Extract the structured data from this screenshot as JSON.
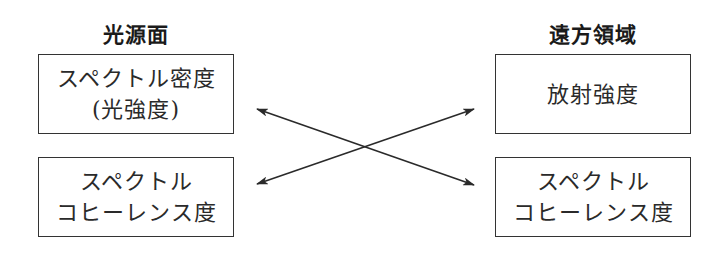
{
  "left_column": {
    "heading": "光源面",
    "boxes": [
      {
        "lines": [
          "スペクトル密度",
          "(光強度)"
        ]
      },
      {
        "lines": [
          "スペクトル",
          "コヒーレンス度"
        ]
      }
    ]
  },
  "right_column": {
    "heading": "遠方領域",
    "boxes": [
      {
        "lines": [
          "放射強度"
        ]
      },
      {
        "lines": [
          "スペクトル",
          "コヒーレンス度"
        ]
      }
    ]
  },
  "arrows": [
    {
      "from": "left_column.boxes.0",
      "to": "right_column.boxes.1",
      "type": "double-headed"
    },
    {
      "from": "left_column.boxes.1",
      "to": "right_column.boxes.0",
      "type": "double-headed"
    }
  ],
  "colors": {
    "line": "#333333",
    "text": "#2a2a2a",
    "background": "#ffffff"
  }
}
